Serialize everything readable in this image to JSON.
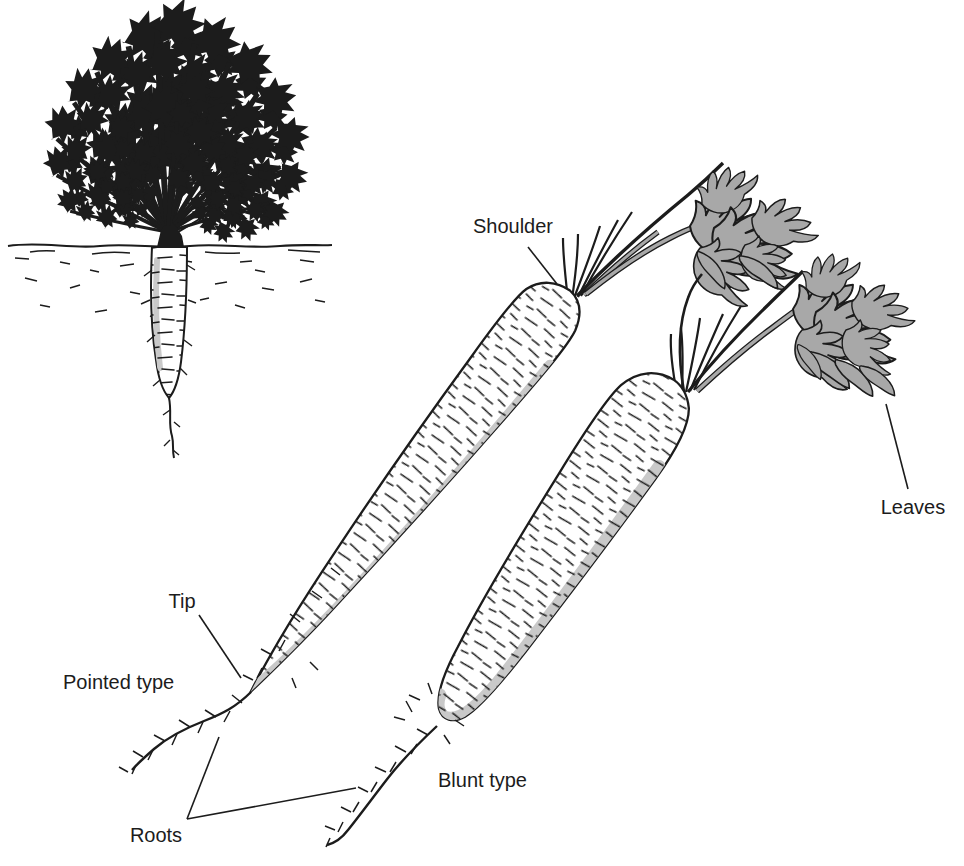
{
  "figure": {
    "labels": {
      "shoulder": "Shoulder",
      "leaves": "Leaves",
      "tip": "Tip",
      "roots": "Roots",
      "pointed_type": "Pointed type",
      "blunt_type": "Blunt type"
    },
    "colors": {
      "line": "#1c1c1c",
      "leaf_gray": "#a8a8a8",
      "shade_gray": "#c9c9c9",
      "background": "#ffffff"
    }
  }
}
